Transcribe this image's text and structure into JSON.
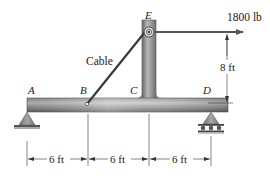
{
  "diagram": {
    "type": "statics-frame",
    "points": {
      "A": "A",
      "B": "B",
      "C": "C",
      "D": "D",
      "E": "E"
    },
    "cable_label": "Cable",
    "force": {
      "label": "1800 lb",
      "direction": "right"
    },
    "dimensions": {
      "vertical": "8 ft",
      "span_ab": "6 ft",
      "span_bc": "6 ft",
      "span_cd": "6 ft"
    },
    "supports": {
      "A": "pin",
      "D": "roller"
    },
    "colors": {
      "beam_dark": "#6e6e6e",
      "beam_light": "#c8c8c8",
      "cable": "#3a3a3a",
      "support": "#8a8a8a",
      "line": "#333333"
    }
  }
}
